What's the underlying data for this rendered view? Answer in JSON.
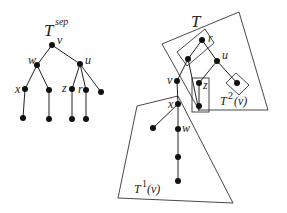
{
  "left_tree": {
    "title": "T",
    "title_sup": "sep",
    "labels": {
      "v": "v",
      "w": "w",
      "u": "u",
      "x": "x",
      "z": "z",
      "r": "r"
    }
  },
  "right_tree": {
    "title": "T",
    "labels": {
      "r": "r",
      "u": "u",
      "v": "v",
      "z": "z",
      "x": "x",
      "w": "w"
    },
    "subtree1": {
      "base": "T",
      "sup": "1",
      "arg": "(v)"
    },
    "subtree2": {
      "base": "T",
      "sup": "2",
      "arg": "(v)"
    }
  }
}
